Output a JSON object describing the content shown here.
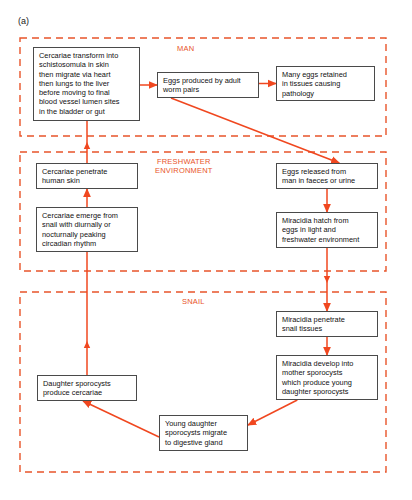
{
  "figure": {
    "panel_label": "(a)",
    "accent_color": "#e8542a",
    "box_border_color": "#4a4a4a",
    "background_color": "#ffffff"
  },
  "regions": [
    {
      "id": "man",
      "label": "MAN",
      "x": 20,
      "y": 38,
      "w": 366,
      "h": 98,
      "label_x": 177,
      "label_y": 44
    },
    {
      "id": "freshwater",
      "label": "FRESHWATER\nENVIRONMENT",
      "x": 20,
      "y": 152,
      "w": 366,
      "h": 119,
      "label_x": 155,
      "label_y": 157
    },
    {
      "id": "snail",
      "label": "SNAIL",
      "x": 20,
      "y": 292,
      "w": 366,
      "h": 180,
      "label_x": 182,
      "label_y": 297
    }
  ],
  "nodes": [
    {
      "id": "cercariae-transform",
      "text": "Cercariae transform into\nschistosomula in skin\nthen  migrate via heart\nthen lungs to the liver\nbefore moving to final\nblood vessel lumen sites\nin the bladder or gut",
      "x": 33,
      "y": 47,
      "w": 107,
      "h": 74
    },
    {
      "id": "eggs-produced",
      "text": "Eggs produced by adult\nworm pairs",
      "x": 157,
      "y": 72,
      "w": 102,
      "h": 26
    },
    {
      "id": "many-eggs-retained",
      "text": "Many eggs retained\nin tissues causing\npathology",
      "x": 276,
      "y": 66,
      "w": 99,
      "h": 35
    },
    {
      "id": "cercariae-penetrate",
      "text": "Cercariae penetrate\nhuman skin",
      "x": 36,
      "y": 163,
      "w": 102,
      "h": 26
    },
    {
      "id": "cercariae-emerge",
      "text": "Cercariae emerge from\nsnail with diurnally or\nnocturnally peaking\ncircadian rhythm",
      "x": 36,
      "y": 207,
      "w": 102,
      "h": 45
    },
    {
      "id": "eggs-released",
      "text": "Eggs released from\nman in faeces or urine",
      "x": 276,
      "y": 163,
      "w": 102,
      "h": 26
    },
    {
      "id": "miracidia-hatch",
      "text": "Miracidia hatch from\neggs in light and\nfreshwater environment",
      "x": 276,
      "y": 212,
      "w": 102,
      "h": 36
    },
    {
      "id": "miracidia-penetrate",
      "text": "Miracidia penetrate\nsnail tissues",
      "x": 276,
      "y": 311,
      "w": 102,
      "h": 26
    },
    {
      "id": "miracidia-develop",
      "text": "Miracidia develop into\nmother sporocysts\nwhich produce young\ndaughter sporocysts",
      "x": 276,
      "y": 355,
      "w": 102,
      "h": 45
    },
    {
      "id": "daughter-sporocysts",
      "text": "Daughter sporocysts\nproduce cercariae",
      "x": 37,
      "y": 375,
      "w": 100,
      "h": 26
    },
    {
      "id": "young-daughter",
      "text": "Young daughter\nsporocysts migrate\nto digestive gland",
      "x": 159,
      "y": 415,
      "w": 89,
      "h": 36
    }
  ],
  "connectors": [
    {
      "id": "transform-to-eggs",
      "from": "cercariae-transform",
      "to": "eggs-produced",
      "kind": "horizontal-right"
    },
    {
      "id": "eggs-to-retained",
      "from": "eggs-produced",
      "to": "many-eggs-retained",
      "kind": "horizontal-right"
    },
    {
      "id": "eggs-to-released",
      "from": "eggs-produced",
      "to": "eggs-released",
      "kind": "diagonal-down-right"
    },
    {
      "id": "released-to-hatch",
      "from": "eggs-released",
      "to": "miracidia-hatch",
      "kind": "vertical-down"
    },
    {
      "id": "hatch-to-penetrate",
      "from": "miracidia-hatch",
      "to": "miracidia-penetrate",
      "kind": "vertical-down"
    },
    {
      "id": "penetrate-to-develop",
      "from": "miracidia-penetrate",
      "to": "miracidia-develop",
      "kind": "vertical-down"
    },
    {
      "id": "develop-to-young",
      "from": "miracidia-develop",
      "to": "young-daughter",
      "kind": "diagonal-down-left"
    },
    {
      "id": "young-to-daughter",
      "from": "young-daughter",
      "to": "daughter-sporocysts",
      "kind": "diagonal-up-left"
    },
    {
      "id": "daughter-to-emerge",
      "from": "daughter-sporocysts",
      "to": "cercariae-emerge",
      "kind": "vertical-up"
    },
    {
      "id": "emerge-to-penetrate-skin",
      "from": "cercariae-emerge",
      "to": "cercariae-penetrate",
      "kind": "vertical-up"
    },
    {
      "id": "penetrate-skin-to-transform",
      "from": "cercariae-penetrate",
      "to": "cercariae-transform",
      "kind": "vertical-up"
    }
  ]
}
